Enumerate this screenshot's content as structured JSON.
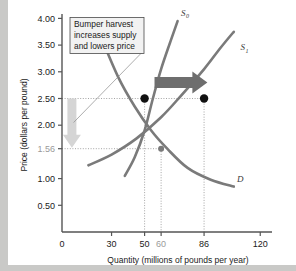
{
  "figure": {
    "background_color": "#c9c9c7",
    "plate_color": "#ffffff"
  },
  "callout": {
    "name": "bumper-harvest-callout",
    "lines": [
      "Bumper harvest",
      "increases supply",
      "and lowers price"
    ],
    "border_color": "#4a4a4a",
    "fill_color": "#f2f2f2"
  },
  "chart_data": {
    "type": "line",
    "title": "",
    "xlabel": "Quantity (millions of pounds per year)",
    "ylabel": "Price (dollars per pound)",
    "xlim": [
      0,
      132
    ],
    "ylim": [
      0,
      4.35
    ],
    "grid": false,
    "legend": "none",
    "xticks": [
      {
        "value": 0,
        "label": "0",
        "muted": false,
        "dotted": false
      },
      {
        "value": 30,
        "label": "30",
        "muted": false,
        "dotted": false
      },
      {
        "value": 50,
        "label": "50",
        "muted": false,
        "dotted": true
      },
      {
        "value": 60,
        "label": "60",
        "muted": true,
        "dotted": true
      },
      {
        "value": 86,
        "label": "86",
        "muted": false,
        "dotted": true
      },
      {
        "value": 120,
        "label": "120",
        "muted": false,
        "dotted": false
      }
    ],
    "yticks": [
      {
        "value": 0.5,
        "label": "0.50",
        "muted": false,
        "dotted": false
      },
      {
        "value": 1.0,
        "label": "1.00",
        "muted": false,
        "dotted": false
      },
      {
        "value": 1.56,
        "label": "1.56",
        "muted": true,
        "dotted": true
      },
      {
        "value": 2.0,
        "label": "2.00",
        "muted": false,
        "dotted": false
      },
      {
        "value": 2.5,
        "label": "2.50",
        "muted": false,
        "dotted": true
      },
      {
        "value": 3.0,
        "label": "3.00",
        "muted": false,
        "dotted": false
      },
      {
        "value": 3.5,
        "label": "3.50",
        "muted": false,
        "dotted": false
      },
      {
        "value": 4.0,
        "label": "4.00",
        "muted": false,
        "dotted": false
      }
    ],
    "series": [
      {
        "name": "S0",
        "label": "S",
        "sublabel": "0",
        "kind": "supply",
        "color": "#7a7a7a",
        "points": [
          [
            38,
            1.05
          ],
          [
            44,
            1.4
          ],
          [
            50,
            1.9
          ],
          [
            55,
            2.5
          ],
          [
            60,
            3.05
          ],
          [
            66,
            3.6
          ],
          [
            70,
            3.95
          ]
        ],
        "label_pos": [
          72,
          4.05
        ]
      },
      {
        "name": "S1",
        "label": "S",
        "sublabel": "1",
        "kind": "supply",
        "color": "#7a7a7a",
        "points": [
          [
            16,
            1.25
          ],
          [
            30,
            1.45
          ],
          [
            45,
            1.75
          ],
          [
            60,
            2.15
          ],
          [
            72,
            2.55
          ],
          [
            86,
            3.05
          ],
          [
            96,
            3.45
          ],
          [
            104,
            3.75
          ]
        ],
        "label_pos": [
          108,
          3.4
        ]
      },
      {
        "name": "D",
        "label": "D",
        "sublabel": "",
        "kind": "demand",
        "color": "#7a7a7a",
        "points": [
          [
            24,
            3.62
          ],
          [
            34,
            2.9
          ],
          [
            44,
            2.35
          ],
          [
            54,
            1.9
          ],
          [
            64,
            1.55
          ],
          [
            76,
            1.2
          ],
          [
            90,
            0.98
          ],
          [
            104,
            0.85
          ]
        ],
        "label_pos": [
          106,
          0.93
        ]
      }
    ],
    "markers": [
      {
        "name": "initial-equilibrium",
        "x": 50,
        "y": 2.5,
        "style": "filled-dot",
        "color": "#111111"
      },
      {
        "name": "shifted-quantity-point",
        "x": 86,
        "y": 2.5,
        "style": "filled-dot",
        "color": "#111111"
      },
      {
        "name": "new-equilibrium",
        "x": 60,
        "y": 1.56,
        "style": "intersection",
        "color": "#7a7a7a"
      }
    ],
    "annotations": [
      {
        "name": "supply-shift-arrow",
        "kind": "block-arrow-right",
        "from": [
          56,
          2.8
        ],
        "to": [
          88,
          2.8
        ],
        "color": "#6e6e6e"
      },
      {
        "name": "price-fall-arrow",
        "kind": "block-arrow-down",
        "from": [
          6,
          2.5
        ],
        "to": [
          6,
          1.58
        ],
        "color": "#d5d5d5"
      },
      {
        "name": "callout-leader-line",
        "kind": "leader",
        "from": [
          48,
          3.35
        ],
        "to": [
          7,
          2.05
        ],
        "color": "#8a8a8a"
      },
      {
        "name": "horizontal-2-50-guide",
        "kind": "dotted-horizontal",
        "y": 2.5,
        "x_from": 0,
        "x_to": 86
      },
      {
        "name": "horizontal-1-56-guide",
        "kind": "dotted-horizontal",
        "y": 1.56,
        "x_from": 0,
        "x_to": 60
      }
    ]
  }
}
